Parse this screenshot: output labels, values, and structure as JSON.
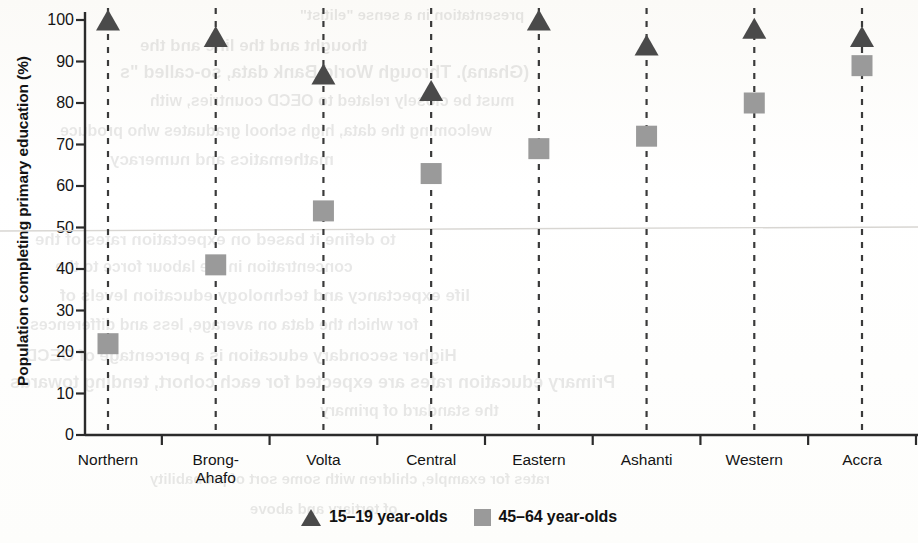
{
  "chart_data": {
    "type": "scatter",
    "title": "",
    "subtitle": "",
    "xlabel": "",
    "ylabel": "Population completing primary education (%)",
    "ylim": [
      0,
      100
    ],
    "yticks": [
      0,
      10,
      20,
      30,
      40,
      50,
      60,
      70,
      80,
      90,
      100
    ],
    "ytick_labels": [
      "0",
      "10",
      "20",
      "30",
      "40",
      "50",
      "60",
      "70",
      "80",
      "90",
      "100"
    ],
    "grid": false,
    "connector_lines": "vertical dashed line at each category joining the two series",
    "legend_position": "bottom-center",
    "categories": [
      "Northern",
      "Brong-\nAhafo",
      "Volta",
      "Central",
      "Eastern",
      "Ashanti",
      "Western",
      "Accra"
    ],
    "series": [
      {
        "name": "15–19 year-olds",
        "marker": "triangle",
        "color": "#4a4a4a",
        "values": [
          100,
          96,
          87,
          83,
          100,
          94,
          98,
          96
        ]
      },
      {
        "name": "45–64 year-olds",
        "marker": "square",
        "color": "#9a9a9a",
        "values": [
          22,
          41,
          54,
          63,
          69,
          72,
          80,
          89
        ]
      }
    ]
  },
  "legend": {
    "entries": [
      {
        "label": "15–19 year-olds",
        "marker": "triangle-marker-icon"
      },
      {
        "label": "45–64 year-olds",
        "marker": "square-marker-icon"
      }
    ]
  },
  "colors": {
    "series_young": "#4a4a4a",
    "series_old": "#9a9a9a",
    "axis": "#2b2b2b",
    "text": "#141414",
    "background": "#fdfdfc"
  },
  "bleed_text": [
    "presentation in a sense \"elitist\"",
    "thought and the line and the",
    "(Ghana). Through World Bank data, so-called \"s",
    "must be closely related to OECD countries, with",
    "welcoming the data, high school graduates who produce",
    "mathematics and numeracy",
    "to define it based on expectation rates of the",
    "concentration in the labour force to the",
    "life expectancy and technology education levels of",
    "for which the data on average, less and differences",
    "Higher secondary education is a percentage of OECD",
    "Primary education rates are expected for each cohort, tending towards",
    "the standard of primary",
    "rates for example, children with some sort of probability",
    "of tertiary and above"
  ]
}
